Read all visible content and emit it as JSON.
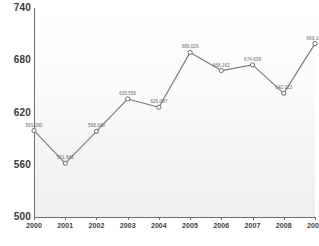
{
  "chart_data": {
    "type": "line",
    "title": "",
    "subtitle": "",
    "xlabel": "",
    "ylabel": "",
    "categories": [
      "2000",
      "2001",
      "2002",
      "2003",
      "2004",
      "2005",
      "2006",
      "2007",
      "2008",
      "2009"
    ],
    "values": [
      599.28,
      561.646,
      598.34,
      635.556,
      626.087,
      689.026,
      668.162,
      674.638,
      642.023,
      699.1
    ],
    "point_labels": [
      "599.280",
      "561.646",
      "598.340",
      "635.556",
      "626.087",
      "689.026",
      "668.162",
      "674.638",
      "642.023",
      "699.100"
    ],
    "series": [
      {
        "name": "",
        "values": [
          599.28,
          561.646,
          598.34,
          635.556,
          626.087,
          689.026,
          668.162,
          674.638,
          642.023,
          699.1
        ]
      }
    ],
    "ylim": [
      500,
      740
    ],
    "yticks": [
      "740",
      "680",
      "620",
      "560",
      "500"
    ],
    "ytick_values": [
      740,
      680,
      620,
      560,
      500
    ],
    "xticks": [
      "2000",
      "2001",
      "2002",
      "2003",
      "2004",
      "2005",
      "2006",
      "2007",
      "2008",
      "2009"
    ],
    "grid": false,
    "legend": "none",
    "line_color": "#7a7a7a",
    "marker_color": "#ffffff",
    "marker_edge_color": "#6e6e6e",
    "axis_color": "#6e6e6e",
    "label_color": "#6b6b6b",
    "tick_color": "#3a3a3a",
    "background_color": "#ffffff"
  }
}
